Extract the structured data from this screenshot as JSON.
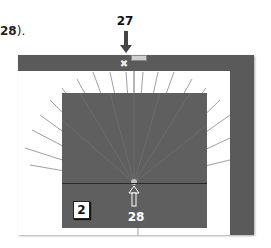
{
  "caption": {
    "prefix_bold": "28",
    "suffix": ")."
  },
  "callouts": [
    {
      "id": "27",
      "label": "27",
      "direction": "down"
    },
    {
      "id": "28",
      "label": "28",
      "direction": "up"
    }
  ],
  "step_badge": {
    "label": "2"
  },
  "handle": {
    "icon": "move-handle-icon",
    "glyph": "✖"
  },
  "colors": {
    "bar": "#5a5a5a",
    "inner": "#5f5f5f",
    "lines": "#9a9a9a",
    "background": "#ffffff"
  }
}
